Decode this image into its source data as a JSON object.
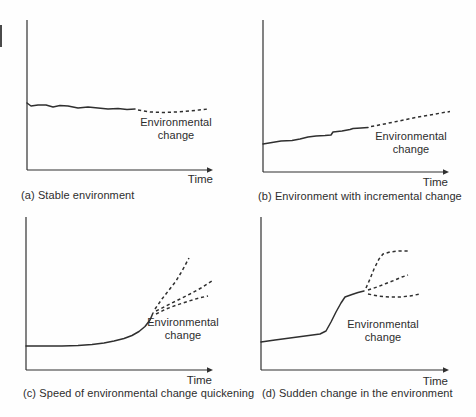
{
  "figure": {
    "background": "#fefefe",
    "line_color": "#2f2f2f",
    "text_color": "#2d2d2d",
    "dash_pattern": "3.2,2.8",
    "edge_artifact": {
      "x": 0,
      "y": 25,
      "height": 22
    },
    "panels": [
      {
        "id": "a",
        "caption": "(a) Stable environment",
        "env_label": "Environmental change",
        "time_label": "Time",
        "axis": {
          "origin_x": 27,
          "top_y": 20,
          "bottom_y": 170,
          "right_x": 213
        },
        "solid_points": [
          [
            27,
            103
          ],
          [
            31,
            106
          ],
          [
            38,
            105
          ],
          [
            46,
            105
          ],
          [
            53,
            107
          ],
          [
            60,
            105.5
          ],
          [
            68,
            106
          ],
          [
            78,
            108
          ],
          [
            88,
            107
          ],
          [
            98,
            108
          ],
          [
            108,
            109
          ],
          [
            118,
            108.5
          ],
          [
            127,
            109.5
          ],
          [
            135,
            109
          ]
        ],
        "dashed_branches": [
          [
            [
              138,
              110
            ],
            [
              150,
              112
            ],
            [
              163,
              112.5
            ],
            [
              176,
              112
            ],
            [
              189,
              111
            ],
            [
              199,
              110
            ],
            [
              208,
              109
            ]
          ]
        ],
        "label_cx": 176,
        "label_top": 116,
        "label_width": 84,
        "time_right": 213,
        "time_top": 173,
        "caption_x": 21,
        "caption_y": 189
      },
      {
        "id": "b",
        "caption": "(b) Environment with incremental change",
        "env_label": "Environmental change",
        "time_label": "Time",
        "axis": {
          "origin_x": 263,
          "top_y": 20,
          "bottom_y": 172,
          "right_x": 449
        },
        "solid_points": [
          [
            263,
            144
          ],
          [
            272,
            142.5
          ],
          [
            281,
            141
          ],
          [
            292,
            140.5
          ],
          [
            300,
            139
          ],
          [
            308,
            137
          ],
          [
            316,
            136
          ],
          [
            325,
            135.5
          ],
          [
            331,
            135
          ],
          [
            333,
            132
          ],
          [
            342,
            131
          ],
          [
            350,
            129.5
          ],
          [
            353,
            128.5
          ],
          [
            361,
            128
          ],
          [
            368,
            127.5
          ]
        ],
        "dashed_branches": [
          [
            [
              371,
              126.5
            ],
            [
              382,
              124.5
            ],
            [
              394,
              122
            ],
            [
              406,
              119.5
            ],
            [
              418,
              117
            ],
            [
              430,
              115
            ],
            [
              441,
              113
            ],
            [
              450,
              111.5
            ]
          ]
        ],
        "label_cx": 411,
        "label_top": 130,
        "label_width": 84,
        "time_right": 448,
        "time_top": 176,
        "caption_x": 258,
        "caption_y": 190
      },
      {
        "id": "c",
        "caption": "(c) Speed of environmental change quickening",
        "env_label": "Environmental change",
        "time_label": "Time",
        "axis": {
          "origin_x": 26,
          "top_y": 217,
          "bottom_y": 370,
          "right_x": 213
        },
        "solid_points": [
          [
            26,
            346
          ],
          [
            45,
            346
          ],
          [
            62,
            346
          ],
          [
            78,
            345.5
          ],
          [
            92,
            344.5
          ],
          [
            104,
            343
          ],
          [
            114,
            341
          ],
          [
            124,
            338.5
          ],
          [
            132,
            335.5
          ],
          [
            139,
            331.5
          ],
          [
            145,
            326.5
          ],
          [
            150,
            320
          ],
          [
            153,
            313
          ]
        ],
        "dashed_branches": [
          [
            [
              155,
              309
            ],
            [
              162,
              299
            ],
            [
              169,
              290
            ],
            [
              176,
              281
            ],
            [
              182,
              271
            ],
            [
              189,
              258
            ]
          ],
          [
            [
              156,
              311
            ],
            [
              166,
              306
            ],
            [
              178,
              300
            ],
            [
              190,
              294
            ],
            [
              201,
              288
            ],
            [
              212,
              281
            ]
          ],
          [
            [
              156,
              314
            ],
            [
              166,
              309
            ],
            [
              177,
              305
            ],
            [
              189,
              301
            ],
            [
              199,
              298
            ],
            [
              208,
              296
            ]
          ]
        ],
        "label_cx": 183,
        "label_top": 316,
        "label_width": 84,
        "time_right": 212,
        "time_top": 374,
        "caption_x": 23,
        "caption_y": 387
      },
      {
        "id": "d",
        "caption": "(d) Sudden change in the environment",
        "env_label": "Environmental change",
        "time_label": "Time",
        "axis": {
          "origin_x": 261,
          "top_y": 217,
          "bottom_y": 370,
          "right_x": 449
        },
        "solid_points": [
          [
            261,
            342
          ],
          [
            275,
            340
          ],
          [
            290,
            338
          ],
          [
            305,
            336
          ],
          [
            320,
            334
          ],
          [
            326,
            331
          ],
          [
            331,
            322
          ],
          [
            336,
            312
          ],
          [
            341,
            303
          ],
          [
            345,
            297
          ],
          [
            352,
            294.5
          ],
          [
            358,
            292.5
          ],
          [
            364,
            291
          ]
        ],
        "dashed_branches": [
          [
            [
              366,
              288
            ],
            [
              370,
              279
            ],
            [
              374,
              269
            ],
            [
              379,
              259
            ],
            [
              383,
              254
            ],
            [
              390,
              252
            ],
            [
              399,
              251
            ],
            [
              408,
              251
            ]
          ],
          [
            [
              368,
              290
            ],
            [
              377,
              287
            ],
            [
              386,
              283.5
            ],
            [
              395,
              280
            ],
            [
              402,
              277
            ],
            [
              408,
              275
            ]
          ],
          [
            [
              368,
              294
            ],
            [
              378,
              296
            ],
            [
              390,
              297
            ],
            [
              400,
              297
            ],
            [
              410,
              296
            ],
            [
              420,
              294
            ]
          ]
        ],
        "label_cx": 383,
        "label_top": 318,
        "label_width": 84,
        "time_right": 448,
        "time_top": 375,
        "caption_x": 262,
        "caption_y": 387
      }
    ]
  }
}
